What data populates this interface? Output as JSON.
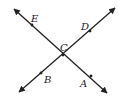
{
  "diagram": {
    "type": "intersecting-lines",
    "stroke_color": "#222222",
    "background": "#ffffff",
    "lines": [
      {
        "name": "line-EA",
        "x1": 14,
        "y1": 9,
        "x2": 107,
        "y2": 93,
        "through": [
          "E",
          "C",
          "A"
        ]
      },
      {
        "name": "line-BD",
        "x1": 19,
        "y1": 92,
        "x2": 115,
        "y2": 8,
        "through": [
          "B",
          "C",
          "D"
        ]
      }
    ],
    "points": [
      {
        "label": "E",
        "x": 32,
        "y": 25,
        "lx": 31,
        "ly": 22
      },
      {
        "label": "D",
        "x": 90,
        "y": 31,
        "lx": 81,
        "ly": 30
      },
      {
        "label": "C",
        "x": 63,
        "y": 55,
        "lx": 60,
        "ly": 51
      },
      {
        "label": "B",
        "x": 41,
        "y": 73,
        "lx": 44,
        "ly": 83
      },
      {
        "label": "A",
        "x": 91,
        "y": 76,
        "lx": 80,
        "ly": 87
      }
    ]
  }
}
